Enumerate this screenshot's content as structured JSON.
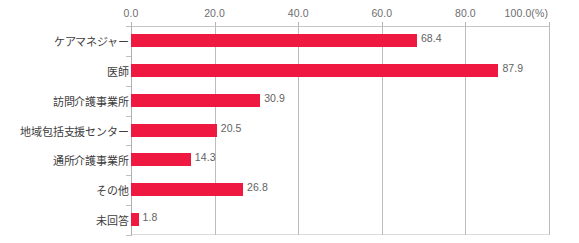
{
  "chart_data": {
    "type": "bar",
    "orientation": "horizontal",
    "title": "",
    "xlabel": "(%)",
    "ylabel": "",
    "categories": [
      "ケアマネジャー",
      "医師",
      "訪問介護事業所",
      "地域包括支援センター",
      "通所介護事業所",
      "その他",
      "未回答"
    ],
    "values": [
      68.4,
      87.9,
      30.9,
      20.5,
      14.3,
      26.8,
      1.8
    ],
    "value_labels": [
      "68.4",
      "87.9",
      "30.9",
      "20.5",
      "14.3",
      "26.8",
      "1.8"
    ],
    "xlim": [
      0,
      100
    ],
    "xticks": [
      0,
      20,
      40,
      60,
      80,
      100
    ],
    "xtick_labels": [
      "0.0",
      "20.0",
      "40.0",
      "60.0",
      "80.0",
      "100.0"
    ],
    "unit_label": "(%)",
    "grid": true,
    "legend": false,
    "bar_color": "#ee1840",
    "grid_color": "#bcbcbc",
    "text_color": "#3d3d3d"
  }
}
